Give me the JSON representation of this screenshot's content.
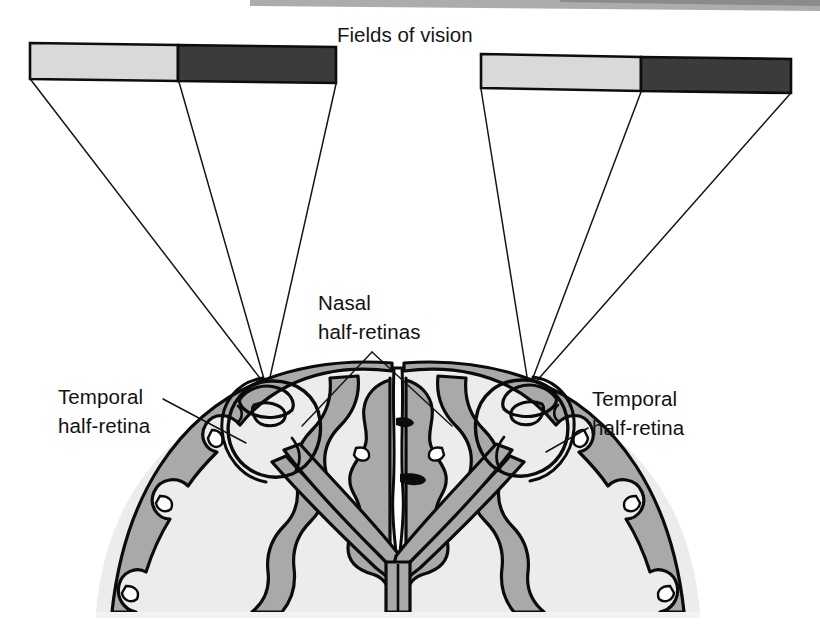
{
  "figure": {
    "type": "anatomical-diagram",
    "background_color": "#ffffff"
  },
  "title": {
    "text": "Fields of vision",
    "x": 337,
    "y": 42
  },
  "palette": {
    "ink": "#0b0b0b",
    "light_field": "#d8d8d8",
    "dark_field": "#3b3b3b",
    "gray_matter": "#a8a8a8",
    "white_matter": "#ebebeb",
    "eye_fill": "#ededed",
    "scan_edge": "#9a9a9a",
    "page": "#ffffff"
  },
  "fields_of_vision": {
    "bars": [
      {
        "name": "left-visual-field-bar",
        "side": "left",
        "x_left": 30,
        "x_split": 178,
        "x_right": 336,
        "y_top": 43,
        "y_bottom": 79,
        "skew_px": 6,
        "segments": [
          {
            "name": "left-field-light-half",
            "shade": "light",
            "color": "#d8d8d8"
          },
          {
            "name": "left-field-dark-half",
            "shade": "dark",
            "color": "#3b3b3b"
          }
        ]
      },
      {
        "name": "right-visual-field-bar",
        "side": "right",
        "x_left": 481,
        "x_split": 641,
        "x_right": 791,
        "y_top": 54,
        "y_bottom": 88,
        "skew_px": 6,
        "segments": [
          {
            "name": "right-field-light-half",
            "shade": "light",
            "color": "#d8d8d8"
          },
          {
            "name": "right-field-dark-half",
            "shade": "dark",
            "color": "#3b3b3b"
          }
        ]
      }
    ],
    "projection_rays": [
      {
        "name": "left-ray-outer",
        "from": [
          32,
          80
        ],
        "to": [
          266,
          386
        ]
      },
      {
        "name": "left-ray-middle",
        "from": [
          180,
          82
        ],
        "to": [
          266,
          386
        ]
      },
      {
        "name": "left-ray-inner",
        "from": [
          336,
          84
        ],
        "to": [
          266,
          386
        ]
      },
      {
        "name": "right-ray-outer",
        "from": [
          482,
          89
        ],
        "to": [
          531,
          383
        ]
      },
      {
        "name": "right-ray-middle",
        "from": [
          641,
          91
        ],
        "to": [
          531,
          383
        ]
      },
      {
        "name": "right-ray-inner",
        "from": [
          790,
          93
        ],
        "to": [
          531,
          383
        ]
      }
    ]
  },
  "labels": [
    {
      "name": "label-temporal-half-retina-left",
      "lines": [
        "Temporal",
        "half-retina"
      ],
      "x": 58,
      "y": 404,
      "align": "start",
      "leader": {
        "from": [
          163,
          399
        ],
        "to": [
          243,
          441
        ]
      }
    },
    {
      "name": "label-nasal-half-retinas",
      "lines": [
        "Nasal",
        "half-retinas"
      ],
      "x": 318,
      "y": 310,
      "align": "start",
      "leaders": [
        {
          "from": [
            372,
            352
          ],
          "to": [
            302,
            424
          ]
        },
        {
          "from": [
            372,
            352
          ],
          "to": [
            452,
            424
          ]
        }
      ]
    },
    {
      "name": "label-temporal-half-retina-right",
      "lines": [
        "Temporal",
        "half-retina"
      ],
      "x": 592,
      "y": 406,
      "align": "start",
      "leader": {
        "from": [
          586,
          430
        ],
        "to": [
          548,
          452
        ]
      }
    }
  ],
  "anatomy": {
    "structures": [
      {
        "name": "left-eyeball",
        "center": [
          272,
          424
        ],
        "rx": 44,
        "ry": 44
      },
      {
        "name": "right-eyeball",
        "center": [
          524,
          423
        ],
        "rx": 44,
        "ry": 44
      },
      {
        "name": "left-lens",
        "center": [
          259,
          404
        ]
      },
      {
        "name": "right-lens",
        "center": [
          512,
          403
        ]
      },
      {
        "name": "cerebral-cortex-gray-matter",
        "fill": "#a8a8a8"
      },
      {
        "name": "cerebral-white-matter",
        "fill": "#ebebeb"
      },
      {
        "name": "longitudinal-fissure",
        "x": 398
      },
      {
        "name": "optic-nerve-left"
      },
      {
        "name": "optic-nerve-right"
      },
      {
        "name": "optic-chiasm",
        "center": [
          398,
          560
        ]
      }
    ]
  },
  "scan_artifact": {
    "name": "scan-edge-shadow",
    "visible": true,
    "color": "#9a9a9a"
  }
}
